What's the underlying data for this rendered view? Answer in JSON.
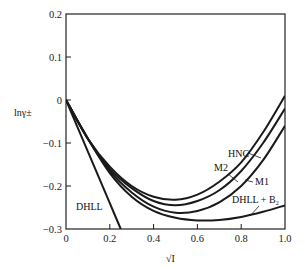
{
  "chart_data": {
    "type": "line",
    "title": "",
    "xlabel": "√I",
    "ylabel": "lnγ±",
    "xlim": [
      0,
      1.0
    ],
    "ylim": [
      -0.3,
      0.2
    ],
    "grid": false,
    "legend_position": "inline labels",
    "x_ticks": [
      "0",
      "0.2",
      "0.4",
      "0.6",
      "0.8",
      "1.0"
    ],
    "y_ticks": [
      "0.2",
      "0.1",
      "0",
      "−0.1",
      "−0.2",
      "−0.3"
    ],
    "series": [
      {
        "name": "DHLL",
        "x": [
          0,
          0.05,
          0.1,
          0.15,
          0.2,
          0.25
        ],
        "y": [
          0,
          -0.06,
          -0.12,
          -0.18,
          -0.24,
          -0.3
        ]
      },
      {
        "name": "HNC",
        "x": [
          0,
          0.1,
          0.2,
          0.3,
          0.4,
          0.5,
          0.6,
          0.7,
          0.8,
          0.9,
          1.0
        ],
        "y": [
          0,
          -0.09,
          -0.155,
          -0.2,
          -0.225,
          -0.232,
          -0.22,
          -0.19,
          -0.145,
          -0.075,
          0.01
        ]
      },
      {
        "name": "M2",
        "x": [
          0,
          0.1,
          0.2,
          0.3,
          0.4,
          0.5,
          0.6,
          0.7,
          0.8,
          0.9,
          1.0
        ],
        "y": [
          0,
          -0.09,
          -0.16,
          -0.205,
          -0.235,
          -0.245,
          -0.235,
          -0.21,
          -0.165,
          -0.1,
          -0.02
        ]
      },
      {
        "name": "M1",
        "x": [
          0,
          0.1,
          0.2,
          0.3,
          0.4,
          0.5,
          0.6,
          0.7,
          0.8,
          0.9,
          1.0
        ],
        "y": [
          0,
          -0.09,
          -0.165,
          -0.215,
          -0.248,
          -0.262,
          -0.258,
          -0.238,
          -0.2,
          -0.14,
          -0.06
        ]
      },
      {
        "name": "DHLL + B2",
        "x": [
          0,
          0.1,
          0.2,
          0.3,
          0.4,
          0.5,
          0.6,
          0.7,
          0.8,
          0.9,
          1.0
        ],
        "y": [
          0,
          -0.09,
          -0.17,
          -0.225,
          -0.258,
          -0.274,
          -0.28,
          -0.279,
          -0.272,
          -0.26,
          -0.245
        ]
      }
    ],
    "labels": [
      {
        "text": "DHLL",
        "series": "DHLL"
      },
      {
        "text": "HNC",
        "series": "HNC"
      },
      {
        "text": "M2",
        "series": "M2"
      },
      {
        "text": "M1",
        "series": "M1"
      },
      {
        "text": "DHLL + B₂",
        "series": "DHLL + B2"
      }
    ]
  },
  "axes": {
    "y_title": "lnγ±",
    "x_title": "√I"
  },
  "colors": {
    "line": "#1a1a1a",
    "background": "#ffffff"
  }
}
